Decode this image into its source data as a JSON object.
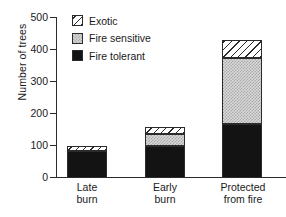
{
  "chart_data": {
    "type": "bar",
    "subtype": "stacked",
    "title": "",
    "xlabel": "",
    "ylabel": "Number of trees",
    "categories": [
      "Late\nburn",
      "Early\nburn",
      "Protected\nfrom fire"
    ],
    "series": [
      {
        "name": "Fire tolerant",
        "values": [
          84,
          100,
          168
        ],
        "color": "#131313",
        "pattern": "solid"
      },
      {
        "name": "Fire sensitive",
        "values": [
          0,
          38,
          204
        ],
        "color": "#d8d8d8",
        "pattern": "stipple"
      },
      {
        "name": "Exotic",
        "values": [
          16,
          22,
          58
        ],
        "color": "#ffffff",
        "pattern": "diagonal-hatch"
      }
    ],
    "totals": [
      100,
      160,
      430
    ],
    "ylim": [
      0,
      500
    ],
    "yticks": [
      0,
      100,
      200,
      300,
      400,
      500
    ],
    "ytick_labels": [
      "0",
      "100",
      "200",
      "300",
      "400",
      "500"
    ],
    "grid": false,
    "legend_position": "top-left",
    "legend_order": [
      "Exotic",
      "Fire sensitive",
      "Fire tolerant"
    ]
  },
  "legend": {
    "items": [
      {
        "label": "Exotic",
        "swatch": "hatch-swatch"
      },
      {
        "label": "Fire sensitive",
        "swatch": "gray-swatch"
      },
      {
        "label": "Fire tolerant",
        "swatch": "black-swatch"
      }
    ]
  },
  "axes": {
    "y_title": "Number of trees",
    "y_ticks": [
      "500",
      "400",
      "300",
      "200",
      "100",
      "0"
    ],
    "x_labels": [
      "Late\nburn",
      "Early\nburn",
      "Protected\nfrom fire"
    ]
  }
}
